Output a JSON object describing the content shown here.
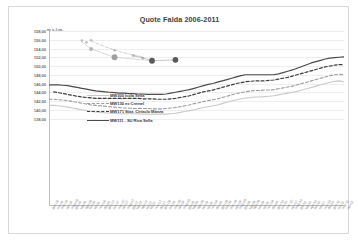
{
  "chart_data": {
    "type": "line",
    "title": "Quote Falda 2006-2011",
    "xlabel": "",
    "ylabel": "m s.l.m.",
    "unit_label": "m s.l.m.",
    "ylim": [
      118,
      158
    ],
    "ytick_labels": [
      "158,00",
      "156,00",
      "154,00",
      "152,00",
      "150,00",
      "148,00",
      "146,00",
      "144,00",
      "142,00",
      "140,00",
      "138,00"
    ],
    "ytick_values": [
      158,
      156,
      154,
      152,
      150,
      148,
      146,
      144,
      142,
      140,
      138
    ],
    "grid": true,
    "legend_position": "inside-upper-left",
    "categories": [
      "gen-06",
      "feb-06",
      "mar-06",
      "apr-06",
      "mag-06",
      "giu-06",
      "lug-06",
      "ago-06",
      "set-06",
      "ott-06",
      "nov-06",
      "dic-06",
      "gen-07",
      "feb-07",
      "mar-07",
      "apr-07",
      "mag-07",
      "giu-07",
      "lug-07",
      "ago-07",
      "set-07",
      "ott-07",
      "nov-07",
      "dic-07",
      "gen-08",
      "feb-08",
      "mar-08",
      "apr-08",
      "mag-08",
      "giu-08",
      "lug-08",
      "ago-08",
      "set-08",
      "ott-08",
      "nov-08",
      "dic-08",
      "gen-09",
      "feb-09",
      "mar-09",
      "apr-09",
      "mag-09",
      "giu-09",
      "lug-09",
      "ago-09",
      "set-09",
      "ott-09",
      "nov-09",
      "dic-09",
      "gen-10",
      "feb-10",
      "mar-10",
      "apr-10",
      "mag-10",
      "giu-10",
      "lug-10",
      "ago-10",
      "set-10",
      "ott-10",
      "nov-10",
      "dic-10",
      "gen-11",
      "feb-11",
      "mar-11",
      "apr-11"
    ],
    "series": [
      {
        "name": "MW300 Isola Sella",
        "style": "solid",
        "color": "#c9c9c9",
        "width": 1.1,
        "values": [
          141.0,
          141.0,
          140.9,
          140.8,
          140.6,
          140.4,
          140.2,
          140.0,
          139.8,
          139.6,
          139.5,
          139.4,
          139.3,
          139.2,
          139.2,
          139.1,
          139.1,
          139.1,
          139.1,
          139.1,
          139.0,
          139.0,
          139.0,
          139.0,
          139.0,
          139.0,
          139.1,
          139.2,
          139.4,
          139.6,
          139.8,
          140.0,
          140.3,
          140.5,
          140.7,
          140.9,
          141.1,
          141.4,
          141.7,
          142.0,
          142.3,
          142.5,
          142.7,
          142.8,
          142.9,
          142.9,
          143.0,
          143.1,
          143.2,
          143.4,
          143.6,
          143.8,
          144.0,
          144.2,
          144.5,
          144.8,
          145.1,
          145.4,
          145.7,
          146.0,
          146.3,
          146.5,
          146.6,
          146.4
        ]
      },
      {
        "name": "MW130 ex Cremel",
        "style": "dashed",
        "color": "#9a9a9a",
        "width": 1.1,
        "values": [
          142.4,
          142.4,
          142.3,
          142.2,
          142.1,
          141.9,
          141.7,
          141.5,
          141.3,
          141.1,
          141.0,
          140.9,
          140.8,
          140.7,
          140.6,
          140.5,
          140.4,
          140.4,
          140.3,
          140.3,
          140.3,
          140.3,
          140.2,
          140.2,
          140.2,
          140.3,
          140.4,
          140.5,
          140.7,
          140.9,
          141.1,
          141.4,
          141.6,
          141.9,
          142.1,
          142.3,
          142.5,
          142.8,
          143.1,
          143.4,
          143.7,
          143.9,
          144.1,
          144.3,
          144.4,
          144.4,
          144.5,
          144.5,
          144.6,
          144.8,
          145.0,
          145.2,
          145.4,
          145.7,
          146.0,
          146.3,
          146.6,
          146.9,
          147.2,
          147.5,
          147.8,
          148.0,
          148.1,
          148.0
        ]
      },
      {
        "name": "MW171 Staz. Ciriaclo Manza",
        "style": "dashed",
        "color": "#3d3d3d",
        "width": 1.2,
        "values": [
          null,
          144.1,
          143.9,
          143.7,
          143.5,
          143.3,
          143.1,
          142.9,
          142.8,
          142.7,
          142.6,
          142.6,
          142.6,
          142.6,
          142.6,
          142.6,
          142.6,
          142.6,
          142.6,
          142.6,
          142.5,
          142.5,
          142.5,
          142.4,
          142.4,
          142.4,
          142.5,
          142.6,
          142.8,
          143.0,
          143.2,
          143.5,
          143.8,
          144.1,
          144.3,
          144.5,
          144.8,
          145.1,
          145.4,
          145.7,
          146.0,
          146.2,
          146.4,
          146.5,
          146.6,
          146.6,
          146.6,
          146.7,
          146.8,
          147.0,
          147.2,
          147.4,
          147.7,
          148.0,
          148.3,
          148.6,
          148.9,
          149.2,
          149.5,
          149.8,
          150.0,
          150.2,
          150.3,
          150.3
        ]
      },
      {
        "name": "MW111 - SU Riva Sella",
        "style": "solid",
        "color": "#4a4a4a",
        "width": 1.2,
        "values": [
          145.7,
          145.7,
          145.7,
          145.6,
          145.5,
          145.3,
          145.1,
          144.9,
          144.7,
          144.5,
          144.3,
          144.2,
          144.1,
          144.0,
          143.9,
          143.8,
          143.8,
          143.7,
          143.7,
          143.6,
          143.6,
          143.5,
          143.5,
          143.5,
          143.5,
          143.6,
          143.8,
          144.0,
          144.2,
          144.4,
          144.6,
          144.9,
          145.2,
          145.5,
          145.8,
          146.0,
          146.3,
          146.6,
          146.9,
          147.2,
          147.5,
          147.8,
          148.0,
          148.0,
          148.0,
          148.0,
          148.0,
          148.0,
          148.0,
          148.2,
          148.5,
          148.8,
          149.1,
          149.5,
          149.9,
          150.3,
          150.7,
          151.0,
          151.3,
          151.6,
          151.8,
          151.9,
          152.0,
          152.1
        ]
      }
    ],
    "annotation_points": [
      {
        "x_index": 7,
        "value": 155.8,
        "size": "small",
        "color": "#c0c0c0"
      },
      {
        "x_index": 8,
        "value": 155.4,
        "size": "small",
        "color": "#c0c0c0"
      },
      {
        "x_index": 9,
        "value": 155.9,
        "size": "small",
        "color": "#c0c0c0"
      },
      {
        "x_index": 9,
        "value": 153.9,
        "size": "medium",
        "color": "#b5b5b5"
      },
      {
        "x_index": 14,
        "value": 152.0,
        "size": "large",
        "color": "#9e9e9e"
      },
      {
        "x_index": 14,
        "value": 153.6,
        "size": "small",
        "color": "#b8b8b8"
      },
      {
        "x_index": 18,
        "value": 152.4,
        "size": "small",
        "color": "#b0b0b0"
      },
      {
        "x_index": 20,
        "value": 151.8,
        "size": "small",
        "color": "#a8a8a8"
      },
      {
        "x_index": 22,
        "value": 151.2,
        "size": "large",
        "color": "#5a5a5a"
      },
      {
        "x_index": 27,
        "value": 151.4,
        "size": "large",
        "color": "#5a5a5a"
      }
    ],
    "annotation_lines": [
      {
        "points": [
          [
            7,
            155.5
          ],
          [
            9,
            153.9
          ],
          [
            14,
            152.0
          ],
          [
            22,
            151.2
          ]
        ],
        "color": "#cfcfcf",
        "style": "solid"
      },
      {
        "points": [
          [
            9,
            155.7
          ],
          [
            12,
            154.4
          ],
          [
            15,
            153.3
          ],
          [
            18,
            152.5
          ],
          [
            20,
            152.1
          ]
        ],
        "color": "#c4c4c4",
        "style": "dashed"
      },
      {
        "points": [
          [
            18,
            152.3
          ],
          [
            20,
            151.9
          ],
          [
            22,
            151.2
          ],
          [
            27,
            151.4
          ]
        ],
        "color": "#b9b9b9",
        "style": "solid"
      }
    ]
  }
}
